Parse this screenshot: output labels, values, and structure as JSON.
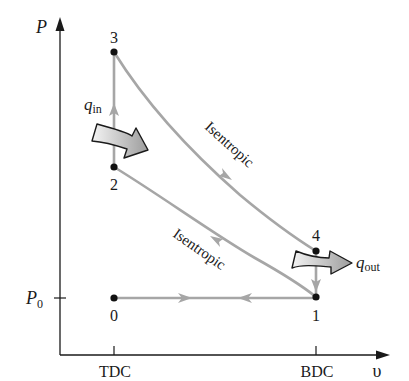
{
  "diagram": {
    "title": "",
    "type": "P-v diagram (ideal Otto cycle with intake/exhaust)",
    "axes": {
      "y_label": "P",
      "x_label": "υ",
      "y_tick_label": "P0",
      "y_tick_main": "P",
      "y_tick_sub": "0",
      "x_ticks": [
        "TDC",
        "BDC"
      ]
    },
    "points": [
      {
        "id": "0",
        "label": "0"
      },
      {
        "id": "1",
        "label": "1"
      },
      {
        "id": "2",
        "label": "2"
      },
      {
        "id": "3",
        "label": "3"
      },
      {
        "id": "4",
        "label": "4"
      }
    ],
    "processes": [
      {
        "from": "1",
        "to": "2",
        "label": "Isentropic"
      },
      {
        "from": "2",
        "to": "3",
        "label": ""
      },
      {
        "from": "3",
        "to": "4",
        "label": "Isentropic"
      },
      {
        "from": "4",
        "to": "1",
        "label": ""
      },
      {
        "from": "0",
        "to": "1",
        "label": ""
      },
      {
        "from": "1",
        "to": "0",
        "label": ""
      }
    ],
    "heat": {
      "in_main": "q",
      "in_sub": "in",
      "out_main": "q",
      "out_sub": "out"
    },
    "colors": {
      "process_line": "#a6a6a6",
      "axis": "#1a1a1a",
      "point": "#111111",
      "heat_arrow_fill_light": "#f2f2f2",
      "heat_arrow_fill_dark": "#9a9a9a"
    }
  }
}
